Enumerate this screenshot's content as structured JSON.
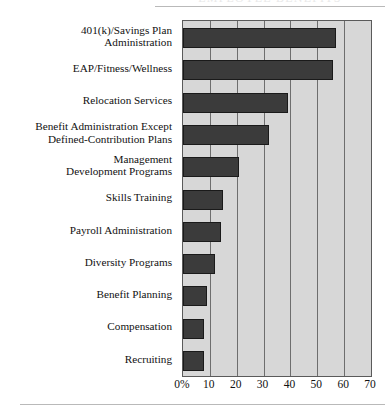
{
  "chart_data": {
    "type": "bar",
    "orientation": "horizontal",
    "title": "",
    "xlabel": "",
    "ylabel": "",
    "xlim": [
      0,
      70
    ],
    "grid": true,
    "legend": false,
    "categories": [
      "401(k)/Savings Plan Administration",
      "EAP/Fitness/Wellness",
      "Relocation Services",
      "Benefit Administration Except Defined-Contribution Plans",
      "Management Development Programs",
      "Skills Training",
      "Payroll Administration",
      "Diversity Programs",
      "Benefit Planning",
      "Compensation",
      "Recruiting"
    ],
    "values": [
      57,
      56,
      39,
      32,
      21,
      15,
      14,
      12,
      9,
      8,
      8
    ],
    "tick_labels": [
      "0%",
      "10",
      "20",
      "30",
      "40",
      "50",
      "60",
      "70"
    ],
    "tick_values": [
      0,
      10,
      20,
      30,
      40,
      50,
      60,
      70
    ],
    "colors": {
      "bar": "#3b3b3b",
      "bar_edge": "#1a1a1a",
      "plot_background": "#d7d7d7",
      "gridline": "#6e6e6e",
      "axis": "#5a5a5a",
      "text": "#111111",
      "rule": "#b9b9b9"
    }
  },
  "labels": [
    {
      "lines": [
        "401(k)/Savings Plan",
        "Administration"
      ]
    },
    {
      "lines": [
        "EAP/Fitness/Wellness"
      ]
    },
    {
      "lines": [
        "Relocation Services"
      ]
    },
    {
      "lines": [
        "Benefit Administration Except",
        "Defined-Contribution Plans"
      ]
    },
    {
      "lines": [
        "Management",
        "Development Programs"
      ]
    },
    {
      "lines": [
        "Skills Training"
      ]
    },
    {
      "lines": [
        "Payroll Administration"
      ]
    },
    {
      "lines": [
        "Diversity Programs"
      ]
    },
    {
      "lines": [
        "Benefit Planning"
      ]
    },
    {
      "lines": [
        "Compensation"
      ]
    },
    {
      "lines": [
        "Recruiting"
      ]
    }
  ],
  "header": {
    "clipped_title": "EMPLOYEE BENEFITS"
  }
}
